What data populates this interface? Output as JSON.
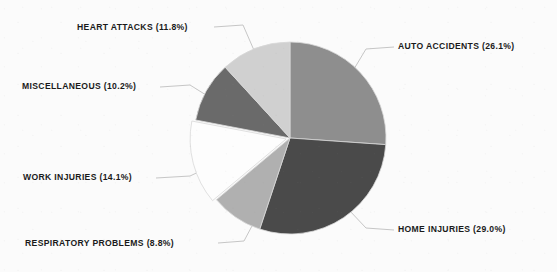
{
  "chart_data": {
    "type": "pie",
    "title": "",
    "subtitle": "",
    "xlabel": "",
    "ylabel": "",
    "legend_position": "none",
    "grid": false,
    "labels_outside_with_leader_lines": true,
    "start_angle_deg": 0,
    "direction": "clockwise",
    "categories": [
      "AUTO ACCIDENTS",
      "HOME INJURIES",
      "RESPIRATORY PROBLEMS",
      "WORK INJURIES",
      "MISCELLANEOUS",
      "HEART ATTACKS"
    ],
    "values": [
      26.1,
      29.0,
      8.8,
      14.1,
      10.2,
      11.8
    ],
    "unit": "%",
    "slices": [
      {
        "name": "AUTO ACCIDENTS",
        "value": 26.1,
        "label": "AUTO ACCIDENTS (26.1%)",
        "color": "#8e8e8e",
        "start_deg": 0.0,
        "end_deg": 93.96,
        "exploded": false
      },
      {
        "name": "HOME INJURIES",
        "value": 29.0,
        "label": "HOME INJURIES (29.0%)",
        "color": "#4a4a4a",
        "start_deg": 93.96,
        "end_deg": 198.36,
        "exploded": false
      },
      {
        "name": "RESPIRATORY PROBLEMS",
        "value": 8.8,
        "label": "RESPIRATORY PROBLEMS (8.8%)",
        "color": "#b0b0b0",
        "start_deg": 198.36,
        "end_deg": 230.04,
        "exploded": false
      },
      {
        "name": "WORK INJURIES",
        "value": 14.1,
        "label": "WORK INJURIES (14.1%)",
        "color": "#fdfdfd",
        "start_deg": 230.04,
        "end_deg": 280.8,
        "exploded": true
      },
      {
        "name": "MISCELLANEOUS",
        "value": 10.2,
        "label": "MISCELLANEOUS (10.2%)",
        "color": "#6a6a6a",
        "start_deg": 280.8,
        "end_deg": 317.52,
        "exploded": false
      },
      {
        "name": "HEART ATTACKS",
        "value": 11.8,
        "label": "HEART ATTACKS (11.8%)",
        "color": "#d0d0d0",
        "start_deg": 317.52,
        "end_deg": 360.0,
        "exploded": false
      }
    ],
    "geometry": {
      "center_x": 290,
      "center_y": 138,
      "radius": 96
    },
    "colors": {
      "background": "#fbfbfb",
      "text": "#1a1a1a",
      "leader_line": "#c6c6c6",
      "slice_outline": "#d8d8d8"
    }
  }
}
